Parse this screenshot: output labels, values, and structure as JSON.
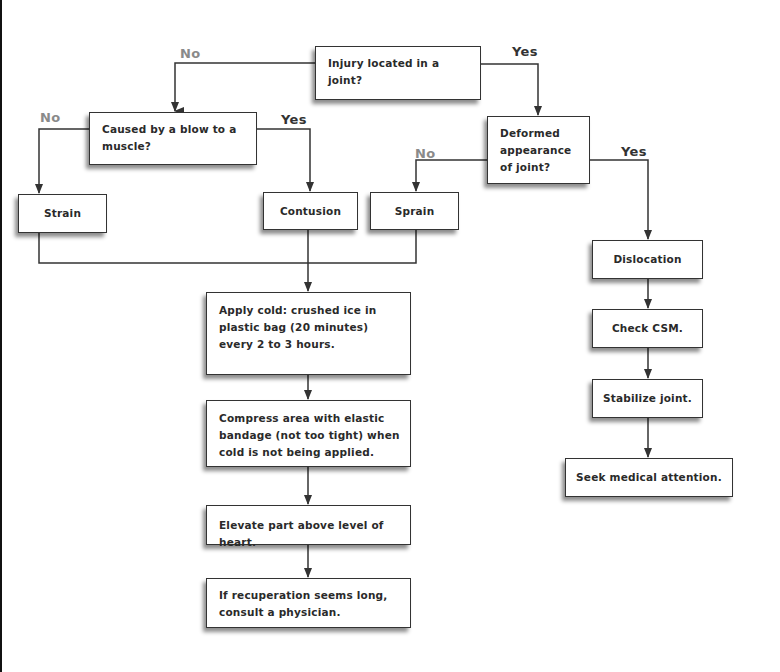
{
  "diagram": {
    "type": "flowchart",
    "nodes": {
      "root": {
        "text": "Injury located in a joint?",
        "kind": "decision"
      },
      "blow": {
        "text": "Caused by a blow to a muscle?",
        "kind": "decision"
      },
      "deformed": {
        "text": "Deformed appearance of joint?",
        "kind": "decision"
      },
      "strain": {
        "text": "Strain",
        "kind": "outcome"
      },
      "contusion": {
        "text": "Contusion",
        "kind": "outcome"
      },
      "sprain": {
        "text": "Sprain",
        "kind": "outcome"
      },
      "dislocation": {
        "text": "Dislocation",
        "kind": "outcome"
      },
      "check_csm": {
        "text": "Check CSM.",
        "kind": "action"
      },
      "stabilize": {
        "text": "Stabilize joint.",
        "kind": "action"
      },
      "seek": {
        "text": "Seek medical attention.",
        "kind": "action"
      },
      "apply_cold": {
        "text": "Apply cold: crushed ice in plastic bag (20 minutes) every 2 to 3 hours.",
        "kind": "action"
      },
      "compress": {
        "text": "Compress area with elastic bandage (not too tight) when cold is not being applied.",
        "kind": "action"
      },
      "elevate": {
        "text": "Elevate part above level of heart.",
        "kind": "action"
      },
      "recuperation": {
        "text": "If recuperation seems long, consult a physician.",
        "kind": "action"
      }
    },
    "labels": {
      "root_no": "No",
      "root_yes": "Yes",
      "blow_no": "No",
      "blow_yes": "Yes",
      "deformed_no": "No",
      "deformed_yes": "Yes"
    },
    "edges": [
      {
        "from": "root",
        "to": "blow",
        "label": "No"
      },
      {
        "from": "root",
        "to": "deformed",
        "label": "Yes"
      },
      {
        "from": "blow",
        "to": "strain",
        "label": "No"
      },
      {
        "from": "blow",
        "to": "contusion",
        "label": "Yes"
      },
      {
        "from": "deformed",
        "to": "sprain",
        "label": "No"
      },
      {
        "from": "deformed",
        "to": "dislocation",
        "label": "Yes"
      },
      {
        "from": "strain",
        "to": "apply_cold"
      },
      {
        "from": "contusion",
        "to": "apply_cold"
      },
      {
        "from": "sprain",
        "to": "apply_cold"
      },
      {
        "from": "apply_cold",
        "to": "compress"
      },
      {
        "from": "compress",
        "to": "elevate"
      },
      {
        "from": "elevate",
        "to": "recuperation"
      },
      {
        "from": "dislocation",
        "to": "check_csm"
      },
      {
        "from": "check_csm",
        "to": "stabilize"
      },
      {
        "from": "stabilize",
        "to": "seek"
      }
    ],
    "colors": {
      "line": "#333333",
      "no_label": "#8a8a8a",
      "yes_label": "#333333",
      "box_border": "#333333",
      "text": "#2a2a2a"
    }
  }
}
